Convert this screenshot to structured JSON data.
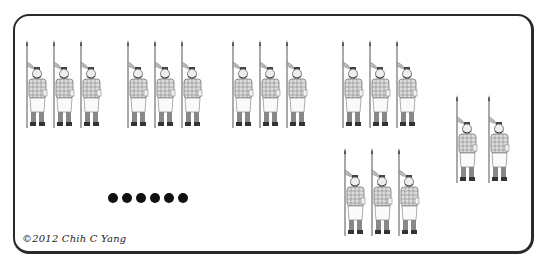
{
  "scene": {
    "description": "Counting worksheet with groups of terracotta-style spear soldiers and a row of dots",
    "frame_color": "#2a2a2a",
    "background": "#ffffff"
  },
  "groups": [
    {
      "id": "group-1",
      "count": 3,
      "x": [
        22,
        49,
        76
      ],
      "y": 40
    },
    {
      "id": "group-2",
      "count": 3,
      "x": [
        123,
        150,
        177
      ],
      "y": 40
    },
    {
      "id": "group-3",
      "count": 3,
      "x": [
        228,
        255,
        282
      ],
      "y": 40
    },
    {
      "id": "group-4",
      "count": 3,
      "x": [
        338,
        365,
        392
      ],
      "y": 40
    },
    {
      "id": "group-5",
      "count": 3,
      "x": [
        340,
        367,
        394
      ],
      "y": 148
    },
    {
      "id": "group-6",
      "count": 2,
      "x": [
        452,
        484
      ],
      "y": 95
    }
  ],
  "dots": {
    "count": 6,
    "x": [
      108,
      122,
      136,
      150,
      164,
      178
    ],
    "y": 193,
    "color": "#111111"
  },
  "footer": {
    "copyright": "©2012 Chih C Yang"
  }
}
